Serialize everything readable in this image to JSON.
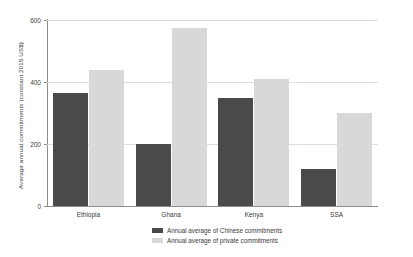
{
  "chart_data": {
    "type": "bar",
    "title": "",
    "xlabel": "",
    "ylabel": "Average annual commitments (constant 2015 US$)",
    "ylim": [
      0,
      600
    ],
    "yticks": [
      0,
      200,
      400,
      600
    ],
    "ytick_labels": [
      "0",
      "200",
      "400",
      "600"
    ],
    "grid": true,
    "grid_axis": "y",
    "legend_position": "bottom-center",
    "categories": [
      "Ethiopia",
      "Ghana",
      "Kenya",
      "SSA"
    ],
    "series": [
      {
        "name": "Annual average of Chinese commitments",
        "color": "#4a4a4a",
        "values": [
          365,
          200,
          350,
          118
        ]
      },
      {
        "name": "Annual average of private commitments",
        "color": "#d8d8d8",
        "values": [
          438,
          575,
          410,
          300
        ]
      }
    ]
  }
}
